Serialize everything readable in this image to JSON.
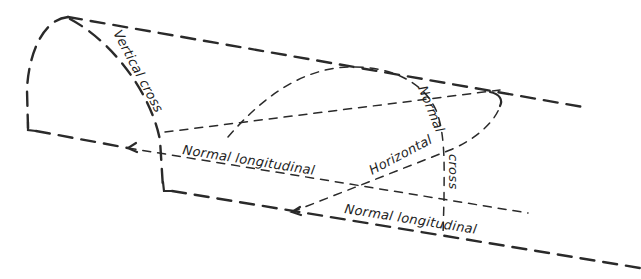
{
  "diagram": {
    "title": "",
    "line_color": "#2a2a2a",
    "background": "#ffffff",
    "labels": {
      "vertical_cross": "Vertical cross",
      "normal_cross_top": "Normal",
      "normal_cross_bottom": "cross",
      "normal_longitudinal_upper": "Normal longitudinal",
      "horizontal": "Horizontal",
      "normal_longitudinal_lower": "Normal longitudinal"
    },
    "sections": [
      {
        "name": "Vertical cross",
        "type": "cross-section curve"
      },
      {
        "name": "Normal cross",
        "type": "cross-section curve"
      },
      {
        "name": "Normal longitudinal",
        "type": "longitudinal line",
        "count": 2
      },
      {
        "name": "Horizontal",
        "type": "longitudinal curve"
      }
    ]
  }
}
